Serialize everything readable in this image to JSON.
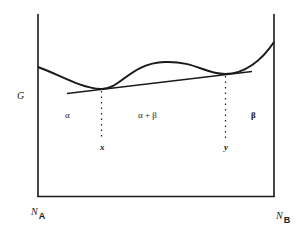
{
  "diagram": {
    "title": "",
    "y_axis_label": "G",
    "x_axis_left_label": {
      "main": "N",
      "sub": "A"
    },
    "x_axis_right_label": {
      "main": "N",
      "sub": "B"
    },
    "regions": [
      {
        "id": "alpha",
        "label": "α"
      },
      {
        "id": "alpha-beta",
        "label": "α + β"
      },
      {
        "id": "beta",
        "label": "β"
      }
    ],
    "tangent_points": [
      {
        "id": "x",
        "label": "x"
      },
      {
        "id": "y",
        "label": "y"
      }
    ],
    "colors": {
      "stroke": "#1a1a1a",
      "background": "#ffffff"
    }
  }
}
